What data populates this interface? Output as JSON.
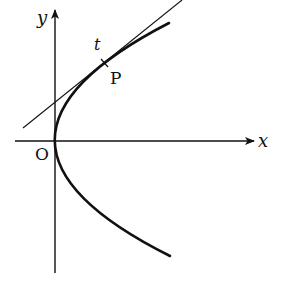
{
  "diagram": {
    "type": "parabola-with-tangent",
    "labels": {
      "x_axis": "x",
      "y_axis": "y",
      "origin": "O",
      "tangent": "t",
      "point": "P"
    },
    "colors": {
      "stroke": "#111111",
      "background": "#ffffff"
    }
  }
}
